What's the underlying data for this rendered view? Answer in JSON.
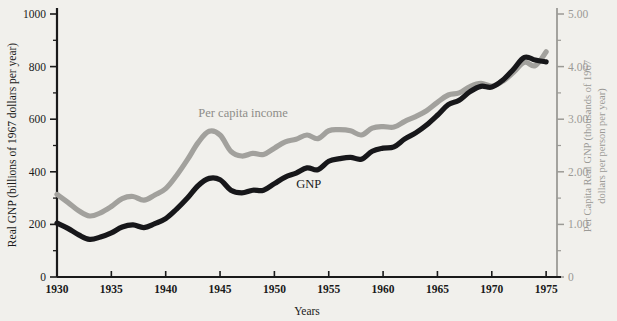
{
  "chart_data": {
    "type": "line",
    "title": "",
    "xlabel": "Years",
    "ylabel": "Real GNP (billions of 1967 dollars per year)",
    "ylabel_right": "Per Capita Real GNP (thousands of 1967 dollars per person per year)",
    "xlim": [
      1930,
      1976
    ],
    "ylim": [
      0,
      1000
    ],
    "ylim_right": [
      0,
      5.0
    ],
    "grid": false,
    "legend_position": "inline-annotations",
    "xticks": [
      1930,
      1935,
      1940,
      1945,
      1950,
      1955,
      1960,
      1965,
      1970,
      1975
    ],
    "xticklabels": [
      "1930",
      "1935",
      "1940",
      "1945",
      "1950",
      "1955",
      "1960",
      "1965",
      "1970",
      "1975"
    ],
    "yticks": [
      0,
      200,
      400,
      600,
      800,
      1000
    ],
    "yticklabels": [
      "0",
      "200",
      "400",
      "600",
      "800",
      "1000"
    ],
    "yminorticks": [
      100,
      300,
      500,
      700,
      900
    ],
    "yticks_right": [
      0,
      1.0,
      2.0,
      3.0,
      4.0,
      5.0
    ],
    "yticklabels_right": [
      "0",
      "1.00",
      "2.00",
      "3.00",
      "4.00",
      "5.00"
    ],
    "yminorticks_right": [
      0.5,
      1.5,
      2.5,
      3.5,
      4.5
    ],
    "series": [
      {
        "name": "GNP",
        "color": "#17171a",
        "axis": "left",
        "label_x": 1952.0,
        "label_y": 340,
        "x": [
          1930,
          1931,
          1932,
          1933,
          1934,
          1935,
          1936,
          1937,
          1938,
          1939,
          1940,
          1941,
          1942,
          1943,
          1944,
          1945,
          1946,
          1947,
          1948,
          1949,
          1950,
          1951,
          1952,
          1953,
          1954,
          1955,
          1956,
          1957,
          1958,
          1959,
          1960,
          1961,
          1962,
          1963,
          1964,
          1965,
          1966,
          1967,
          1968,
          1969,
          1970,
          1971,
          1972,
          1973,
          1974,
          1975
        ],
        "values": [
          205,
          185,
          160,
          143,
          152,
          168,
          190,
          198,
          188,
          203,
          222,
          258,
          300,
          348,
          375,
          370,
          330,
          320,
          330,
          330,
          355,
          380,
          395,
          415,
          408,
          440,
          450,
          455,
          448,
          478,
          490,
          495,
          525,
          548,
          578,
          615,
          655,
          672,
          705,
          725,
          722,
          748,
          790,
          835,
          825,
          818
        ]
      },
      {
        "name": "Per capita income",
        "color": "#a2a19d",
        "axis": "right",
        "label_x": 1943.0,
        "label_y": 3.05,
        "x": [
          1930,
          1931,
          1932,
          1933,
          1934,
          1935,
          1936,
          1937,
          1938,
          1939,
          1940,
          1941,
          1942,
          1943,
          1944,
          1945,
          1946,
          1947,
          1948,
          1949,
          1950,
          1951,
          1952,
          1953,
          1954,
          1955,
          1956,
          1957,
          1958,
          1959,
          1960,
          1961,
          1962,
          1963,
          1964,
          1965,
          1966,
          1967,
          1968,
          1969,
          1970,
          1971,
          1972,
          1973,
          1974,
          1975
        ],
        "values": [
          1.57,
          1.42,
          1.26,
          1.16,
          1.22,
          1.34,
          1.49,
          1.53,
          1.46,
          1.56,
          1.68,
          1.93,
          2.23,
          2.56,
          2.77,
          2.7,
          2.39,
          2.3,
          2.35,
          2.33,
          2.45,
          2.57,
          2.62,
          2.7,
          2.63,
          2.78,
          2.8,
          2.78,
          2.7,
          2.83,
          2.86,
          2.85,
          2.96,
          3.05,
          3.16,
          3.32,
          3.46,
          3.5,
          3.62,
          3.68,
          3.63,
          3.72,
          3.89,
          4.08,
          4.02,
          4.28
        ]
      }
    ]
  },
  "labels": {
    "gnp_label": "GNP",
    "pci_label": "Per capita income",
    "x_axis_title": "Years",
    "y_axis_title": "Real GNP (billions of 1967 dollars per year)",
    "y_axis_right_line1": "Per Capita Real GNP (thousands of 1967",
    "y_axis_right_line2": "dollars per person per year)"
  },
  "colors": {
    "background": "#f1f0ec",
    "gnp_line": "#17171a",
    "pci_line": "#a2a19d",
    "axis_dark": "#1a1a1a",
    "axis_gray": "#9b9a96"
  }
}
